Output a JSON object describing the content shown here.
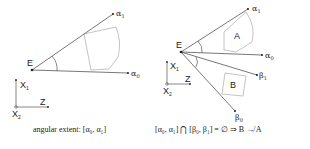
{
  "left_panel": {
    "eye_label": "E",
    "ray_top_label": "α",
    "ray_top_sub": "1",
    "ray_bottom_label": "α",
    "ray_bottom_sub": "0",
    "axis_x1": "X",
    "axis_x1_sub": "1",
    "axis_x2": "X",
    "axis_x2_sub": "2",
    "axis_z": "Z",
    "caption": "angular extent: [α₀, α₁]"
  },
  "right_panel": {
    "eye_label": "E",
    "object_a_label": "A",
    "object_b_label": "B",
    "ray_alpha1_label": "α",
    "ray_alpha1_sub": "1",
    "ray_alpha0_label": "α",
    "ray_alpha0_sub": "0",
    "ray_beta1_label": "β",
    "ray_beta1_sub": "1",
    "ray_beta0_label": "β",
    "ray_beta0_sub": "0",
    "axis_x1": "X",
    "axis_x1_sub": "1",
    "axis_x2": "X",
    "axis_x2_sub": "2",
    "axis_z": "Z",
    "caption": "[α₀, α₁] ⋂ [β₀, β₁] = ∅  ⇒  B ↛ A"
  },
  "colors": {
    "line": "#555555",
    "shape": "#aaaaaa",
    "text": "#222222"
  }
}
